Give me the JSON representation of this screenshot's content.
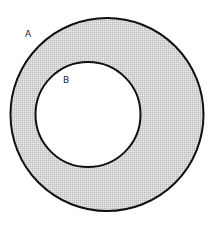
{
  "diagram": {
    "type": "nested-circles",
    "width": 213,
    "height": 225,
    "outer_circle": {
      "label": "A",
      "cx": 107,
      "cy": 114.5,
      "r": 96.5,
      "label_x": 25,
      "label_y": 37
    },
    "inner_circle": {
      "label": "B",
      "cx": 88,
      "cy": 114.5,
      "r": 52.5,
      "label_x": 63,
      "label_y": 83
    },
    "colors": {
      "stroke": "#111111",
      "ring_fill": "#d6d6d6",
      "ring_dot": "#bdbdbd",
      "inner_fill": "#ffffff",
      "background": "#ffffff"
    },
    "stroke_width": 2
  }
}
